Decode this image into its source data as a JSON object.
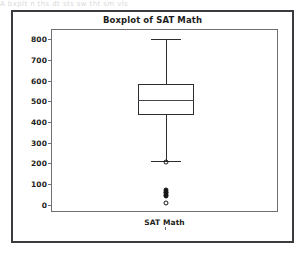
{
  "document_bleed_text": "A  bxplt  n  ths  dt  sts  sw  tht  sm  vls",
  "figure": {
    "title": "Boxplot of SAT Math",
    "xlabel": "SAT Math",
    "ylabel": "",
    "frame_color": "#3a3a3f",
    "axes_color": "#6e6e75",
    "ink_color": "#2b2b30",
    "background": "#ffffff"
  },
  "yaxis": {
    "ticks": [
      0,
      100,
      200,
      300,
      400,
      500,
      600,
      700,
      800
    ],
    "tick_labels": [
      "0",
      "100",
      "200",
      "300",
      "400",
      "500",
      "600",
      "700",
      "800"
    ],
    "min": -40,
    "max": 845
  },
  "chart_data": {
    "type": "box",
    "title": "Boxplot of SAT Math",
    "xlabel": "SAT Math",
    "ylabel": "",
    "ylim": [
      -40,
      845
    ],
    "grid": false,
    "legend": false,
    "categories": [
      "SAT Math"
    ],
    "series": [
      {
        "name": "SAT Math",
        "whisker_low": 210,
        "q1": 435,
        "median": 505,
        "q3": 585,
        "whisker_high": 800,
        "outliers": [
          205,
          70,
          62,
          55,
          48,
          40,
          10
        ],
        "outlier_styles": [
          "open",
          "filled",
          "filled",
          "filled",
          "filled",
          "filled",
          "open"
        ]
      }
    ],
    "tick_labels": [
      "0",
      "100",
      "200",
      "300",
      "400",
      "500",
      "600",
      "700",
      "800"
    ]
  }
}
